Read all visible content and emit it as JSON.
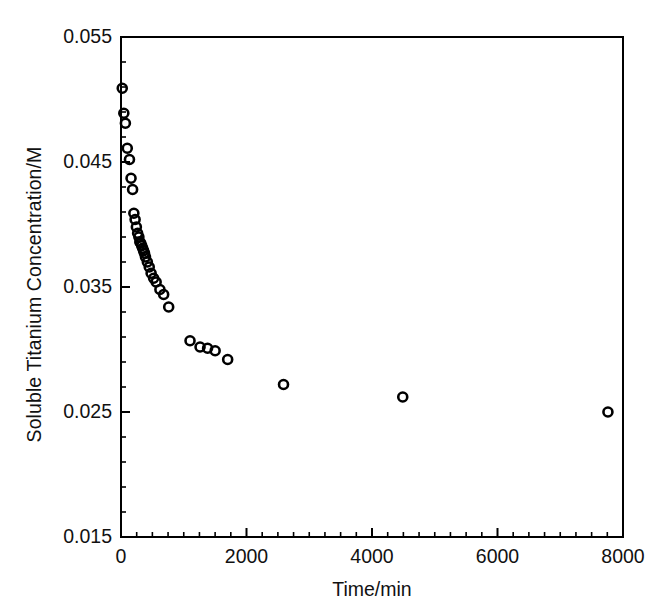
{
  "chart_data": {
    "type": "scatter",
    "title": "",
    "xlabel": "Time/min",
    "ylabel": "Soluble Titanium Concentration/M",
    "xlim": [
      0,
      8000
    ],
    "ylim": [
      0.015,
      0.055
    ],
    "xticks": [
      0,
      2000,
      4000,
      6000,
      8000
    ],
    "xtick_labels": [
      "0",
      "2000",
      "4000",
      "6000",
      "8000"
    ],
    "yticks": [
      0.015,
      0.025,
      0.035,
      0.045,
      0.055
    ],
    "ytick_labels": [
      "0.015",
      "0.025",
      "0.035",
      "0.045",
      "0.055"
    ],
    "x_minor_tick_interval": 250,
    "y_minor_tick_interval": 0.002,
    "grid": false,
    "legend": null,
    "marker": "open-circle",
    "marker_color": "#000000",
    "marker_size_px": 9,
    "series": [
      {
        "name": "Soluble titanium concentration",
        "x": [
          20,
          45,
          70,
          100,
          135,
          160,
          185,
          205,
          225,
          245,
          265,
          285,
          300,
          315,
          330,
          345,
          360,
          375,
          390,
          420,
          450,
          480,
          520,
          560,
          620,
          680,
          760,
          1100,
          1260,
          1380,
          1500,
          1700,
          2590,
          4490,
          7760
        ],
        "y": [
          0.0509,
          0.0489,
          0.0481,
          0.0461,
          0.0452,
          0.0437,
          0.0428,
          0.0409,
          0.0404,
          0.0398,
          0.0393,
          0.039,
          0.0386,
          0.0385,
          0.0383,
          0.0381,
          0.0379,
          0.0377,
          0.0374,
          0.037,
          0.0366,
          0.0361,
          0.0357,
          0.0354,
          0.0348,
          0.0344,
          0.0334,
          0.0307,
          0.0302,
          0.0301,
          0.0299,
          0.0292,
          0.0272,
          0.0262,
          0.025
        ]
      }
    ]
  },
  "axes": {
    "frame_color": "#000000",
    "frame_width_px": 2,
    "background": "#ffffff"
  }
}
